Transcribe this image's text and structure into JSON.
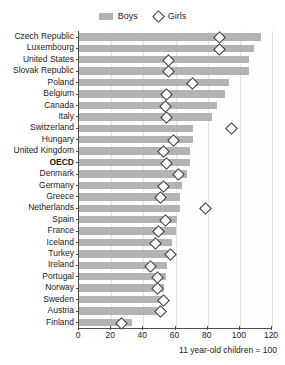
{
  "chart_data": {
    "type": "bar",
    "title": "",
    "clipped_title": "",
    "xlabel": "",
    "ylabel": "",
    "caption": "11 year-old children = 100",
    "xlim": [
      0,
      120
    ],
    "xticks": [
      0,
      20,
      40,
      60,
      80,
      100,
      120
    ],
    "xtick_labels": [
      "0",
      "20",
      "40",
      "60",
      "80",
      "100",
      "120"
    ],
    "grid": true,
    "grid_axis": "x",
    "legend_position": "top-center",
    "legend": [
      {
        "name": "Boys",
        "marker": "bar",
        "color": "#b3b3b3"
      },
      {
        "name": "Girls",
        "marker": "diamond",
        "color": "#ffffff"
      }
    ],
    "categories": [
      "Czech Republic",
      "Luxembourg",
      "United States",
      "Slovak Republic",
      "Poland",
      "Belgium",
      "Canada",
      "Italy",
      "Switzerland",
      "Hungary",
      "United Kingdom",
      "OECD",
      "Denmark",
      "Germany",
      "Greece",
      "Netherlands",
      "Spain",
      "France",
      "Iceland",
      "Turkey",
      "Ireland",
      "Portugal",
      "Norway",
      "Sweden",
      "Austria",
      "Finland"
    ],
    "highlight_category": "OECD",
    "series": [
      {
        "name": "Boys",
        "marker": "bar",
        "color": "#b3b3b3",
        "values": [
          113,
          109,
          106,
          106,
          93,
          91,
          86,
          83,
          71,
          71,
          69,
          69,
          67,
          64,
          63,
          63,
          61,
          60,
          58,
          57,
          55,
          54,
          53,
          53,
          51,
          33
        ]
      },
      {
        "name": "Girls",
        "marker": "diamond",
        "color": "#ffffff",
        "values": [
          87,
          87,
          55,
          55,
          70,
          54,
          53,
          54,
          94,
          58,
          52,
          54,
          61,
          52,
          50,
          78,
          53,
          49,
          47,
          56,
          44,
          48,
          48,
          52,
          50,
          26
        ]
      }
    ]
  }
}
